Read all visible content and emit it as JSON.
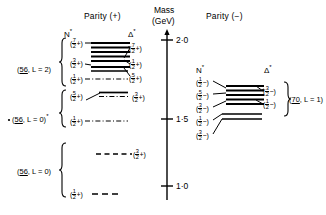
{
  "figure": {
    "type": "energy-level-diagram",
    "headers": {
      "parity_plus": "Parity (+)",
      "parity_minus": "Parity (−)",
      "mass_line1": "Mass",
      "mass_line2": "(GeV)"
    },
    "column_headers": {
      "left_nstar": "N",
      "left_deltastar": "Δ",
      "right_nstar": "N",
      "right_deltastar": "Δ",
      "star_glyph": "*"
    },
    "axis": {
      "label": "Mass (GeV)",
      "unit": "GeV",
      "ticks": [
        {
          "value": "2·0",
          "y": 40
        },
        {
          "value": "1·5",
          "y": 119
        },
        {
          "value": "1·0",
          "y": 186
        }
      ],
      "range": [
        0.85,
        2.15
      ]
    },
    "multiplets": [
      {
        "id": "m56L2",
        "label": "(56, L = 2)",
        "underline": "56",
        "side": "left"
      },
      {
        "id": "m56L0s",
        "label": "(56, L = 0)",
        "underline": "56",
        "side": "left",
        "starred": true
      },
      {
        "id": "m56L0",
        "label": "(56, L = 0)",
        "underline": "56",
        "side": "left"
      },
      {
        "id": "m70L1",
        "label": "(70, L = 1)",
        "underline": "70",
        "side": "right"
      }
    ],
    "left_panel": {
      "parity": "+",
      "nstar_levels": [
        {
          "num": "7",
          "den": "2",
          "sign": "+",
          "y": 43
        },
        {
          "num": "3",
          "den": "2",
          "sign": "+",
          "y": 63
        },
        {
          "num": "1",
          "den": "2",
          "sign": "+",
          "y": 79
        },
        {
          "num": "5",
          "den": "2",
          "sign": "+",
          "y": 96
        },
        {
          "num": "1",
          "den": "2",
          "sign": "+",
          "y": 121
        },
        {
          "num": "1",
          "den": "2",
          "sign": "+",
          "y": 194
        }
      ],
      "deltastar_levels": [
        {
          "num": "7",
          "den": "2",
          "sign": "+",
          "y": 48
        },
        {
          "num": "1",
          "den": "2",
          "sign": "+",
          "y": 64
        },
        {
          "num": "5",
          "den": "2",
          "sign": "+",
          "y": 78
        },
        {
          "num": "3",
          "den": "2",
          "sign": "+",
          "y": 97
        },
        {
          "num": "3",
          "den": "2",
          "sign": "+",
          "y": 154
        }
      ]
    },
    "right_panel": {
      "parity": "−",
      "nstar_levels": [
        {
          "num": "1",
          "den": "2",
          "sign": "−",
          "y": 80
        },
        {
          "num": "5",
          "den": "2",
          "sign": "−",
          "y": 93
        },
        {
          "num": "3",
          "den": "2",
          "sign": "−",
          "y": 106
        },
        {
          "num": "1",
          "den": "2",
          "sign": "−",
          "y": 119
        },
        {
          "num": "3",
          "den": "2",
          "sign": "−",
          "y": 133
        }
      ],
      "deltastar_levels": [
        {
          "num": "3",
          "den": "2",
          "sign": "−",
          "y": 90
        },
        {
          "num": "1",
          "den": "2",
          "sign": "−",
          "y": 103
        }
      ]
    },
    "colors": {
      "ink": "#000000",
      "background": "#ffffff"
    }
  }
}
